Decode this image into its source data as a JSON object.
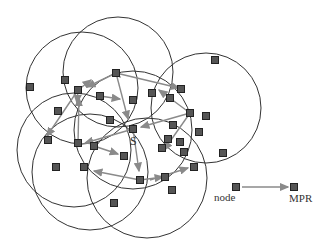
{
  "diagram": {
    "type": "MPR flooding in OLSR network",
    "source_label": "S",
    "circles": [
      {
        "cx": 133,
        "cy": 130,
        "r": 59
      },
      {
        "cx": 82,
        "cy": 88,
        "r": 56
      },
      {
        "cx": 118,
        "cy": 72,
        "r": 55
      },
      {
        "cx": 206,
        "cy": 108,
        "r": 55
      },
      {
        "cx": 74,
        "cy": 150,
        "r": 57
      },
      {
        "cx": 90,
        "cy": 172,
        "r": 58
      },
      {
        "cx": 147,
        "cy": 178,
        "r": 60
      }
    ],
    "nodes": [
      {
        "x": 30,
        "y": 87
      },
      {
        "x": 65,
        "y": 80
      },
      {
        "x": 78,
        "y": 90
      },
      {
        "x": 100,
        "y": 96
      },
      {
        "x": 116,
        "y": 73
      },
      {
        "x": 133,
        "y": 100
      },
      {
        "x": 152,
        "y": 93
      },
      {
        "x": 170,
        "y": 98
      },
      {
        "x": 181,
        "y": 89
      },
      {
        "x": 190,
        "y": 113
      },
      {
        "x": 215,
        "y": 60
      },
      {
        "x": 206,
        "y": 116
      },
      {
        "x": 199,
        "y": 132
      },
      {
        "x": 173,
        "y": 125
      },
      {
        "x": 168,
        "y": 139
      },
      {
        "x": 180,
        "y": 142
      },
      {
        "x": 162,
        "y": 148
      },
      {
        "x": 184,
        "y": 152
      },
      {
        "x": 133,
        "y": 129
      },
      {
        "x": 110,
        "y": 120
      },
      {
        "x": 58,
        "y": 111
      },
      {
        "x": 48,
        "y": 140
      },
      {
        "x": 78,
        "y": 143
      },
      {
        "x": 94,
        "y": 146
      },
      {
        "x": 124,
        "y": 156
      },
      {
        "x": 56,
        "y": 167
      },
      {
        "x": 84,
        "y": 167
      },
      {
        "x": 114,
        "y": 203
      },
      {
        "x": 140,
        "y": 180
      },
      {
        "x": 165,
        "y": 177
      },
      {
        "x": 194,
        "y": 167
      },
      {
        "x": 172,
        "y": 190
      },
      {
        "x": 223,
        "y": 153
      }
    ],
    "arrows": [
      {
        "x1": 78,
        "y1": 90,
        "x2": 47,
        "y2": 136
      },
      {
        "x1": 78,
        "y1": 90,
        "x2": 91,
        "y2": 80
      },
      {
        "x1": 78,
        "y1": 90,
        "x2": 77,
        "y2": 103
      },
      {
        "x1": 116,
        "y1": 73,
        "x2": 87,
        "y2": 87
      },
      {
        "x1": 116,
        "y1": 73,
        "x2": 120,
        "y2": 77
      },
      {
        "x1": 100,
        "y1": 96,
        "x2": 120,
        "y2": 99
      },
      {
        "x1": 116,
        "y1": 73,
        "x2": 128,
        "y2": 119
      },
      {
        "x1": 116,
        "y1": 73,
        "x2": 179,
        "y2": 88
      },
      {
        "x1": 190,
        "y1": 113,
        "x2": 159,
        "y2": 90
      },
      {
        "x1": 190,
        "y1": 113,
        "x2": 141,
        "y2": 127
      },
      {
        "x1": 190,
        "y1": 113,
        "x2": 164,
        "y2": 150
      },
      {
        "x1": 133,
        "y1": 129,
        "x2": 85,
        "y2": 143
      },
      {
        "x1": 133,
        "y1": 129,
        "x2": 139,
        "y2": 171
      },
      {
        "x1": 94,
        "y1": 146,
        "x2": 118,
        "y2": 154
      },
      {
        "x1": 78,
        "y1": 143,
        "x2": 79,
        "y2": 98
      },
      {
        "x1": 140,
        "y1": 180,
        "x2": 94,
        "y2": 171
      },
      {
        "x1": 140,
        "y1": 180,
        "x2": 163,
        "y2": 177
      },
      {
        "x1": 150,
        "y1": 180,
        "x2": 188,
        "y2": 168
      }
    ],
    "legend": {
      "node_label": "node",
      "mpr_label": "MPR",
      "node": {
        "x": 236,
        "y": 187
      },
      "mpr": {
        "x": 294,
        "y": 187
      }
    },
    "colors": {
      "node_fill": "#555555",
      "node_border": "#222222",
      "arrow": "#8a8a8a",
      "circle": "#333333"
    }
  }
}
